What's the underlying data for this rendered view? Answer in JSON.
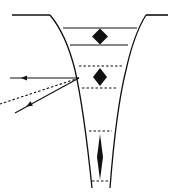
{
  "diagram": {
    "type": "trough-cross-section-with-rays",
    "colors": {
      "ink": "#111111",
      "background": "#ffffff"
    },
    "surface": {
      "left_plateau": [
        [
          12,
          15
        ],
        [
          50,
          15
        ]
      ],
      "right_plateau": [
        [
          146,
          15
        ],
        [
          168,
          15
        ]
      ]
    },
    "walls": {
      "left": "M50 15 Q66 34 75 70 Q84 110 92 188",
      "right": "M146 15 Q134 34 126 70 Q116 110 110 188"
    },
    "bands": [
      {
        "id": "upper",
        "style": "solid",
        "top": {
          "y": 28,
          "x1": 63,
          "x2": 137
        },
        "bottom": {
          "y": 45,
          "x1": 70,
          "x2": 128
        },
        "marker": {
          "shape": "diamond",
          "cx": 100,
          "cy": 36.5,
          "rx": 8,
          "ry": 8
        }
      },
      {
        "id": "middle",
        "style": "dashed",
        "top": {
          "y": 66,
          "x1": 79,
          "x2": 122
        },
        "bottom": {
          "y": 88,
          "x1": 82,
          "x2": 118
        },
        "marker": {
          "shape": "diamond",
          "cx": 100,
          "cy": 77,
          "rx": 7,
          "ry": 9
        }
      },
      {
        "id": "lower",
        "style": "dashed",
        "top": {
          "y": 131,
          "x1": 89,
          "x2": 112
        },
        "bottom": {
          "y": 181,
          "x1": 92,
          "x2": 110
        },
        "marker": {
          "shape": "diamond",
          "cx": 100,
          "cy": 157,
          "rx": 3,
          "ry": 23
        }
      }
    ],
    "rays": [
      {
        "id": "reflected",
        "style": "solid",
        "from": [
          79,
          78
        ],
        "to": [
          10,
          78
        ],
        "arrow_at": [
          24,
          78
        ],
        "direction": "left"
      },
      {
        "id": "refracted-guide",
        "style": "dashed",
        "from": [
          79,
          78
        ],
        "to": [
          0,
          104
        ]
      },
      {
        "id": "incident",
        "style": "solid",
        "from": [
          79,
          78
        ],
        "to": [
          15,
          113
        ],
        "arrow_at": [
          29,
          105
        ],
        "direction": "down-left"
      }
    ]
  }
}
